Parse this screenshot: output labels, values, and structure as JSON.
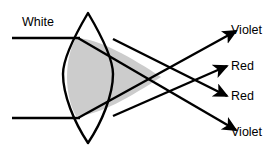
{
  "figure": {
    "background_color": "#ffffff",
    "stroke_color": "#000000",
    "lens_fill_color": "#ffffff",
    "beam_fill_color": "#cccccc",
    "width": 270,
    "height": 148
  },
  "labels": {
    "incident": "White",
    "out_1": "Violet",
    "out_2": "Red",
    "out_3": "Red",
    "out_4": "Violet"
  },
  "optics": {
    "lens_name": "biconvex-lens",
    "lens_center_x": 88,
    "lens_top_apex_y": 13,
    "lens_bottom_apex_y": 143,
    "lens_left_bulge_x": 63,
    "lens_right_bulge_x": 113,
    "incident_ray_top_y": 38,
    "incident_ray_bottom_y": 118,
    "incident_ray_start_x": 12,
    "focus_violet_x": 160,
    "focus_violet_y": 78,
    "focus_red_x": 166,
    "focus_red_y": 76,
    "ray_stroke_width": 2.4
  }
}
